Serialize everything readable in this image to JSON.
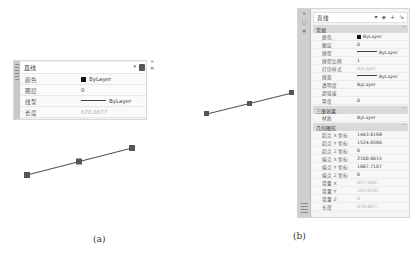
{
  "panel_a": {
    "title": "直线",
    "dropdown_icon": "chevron-down-icon",
    "quick_select_icon": "quick-select-icon",
    "rows": [
      {
        "label": "颜色",
        "value": "ByLayer",
        "swatch": "#111111"
      },
      {
        "label": "图层",
        "value": "0"
      },
      {
        "label": "线型",
        "value": "ByLayer",
        "line": true
      },
      {
        "label": "长度",
        "value": "678.8677",
        "dim": true
      }
    ],
    "side_buttons": [
      "×",
      "≡"
    ],
    "caption": "(a)"
  },
  "panel_b": {
    "strip_buttons": [
      "×",
      "▢",
      "≡"
    ],
    "title": "直线",
    "tools": "▾ ◈ + ⇘",
    "sections": [
      {
        "label": "常规",
        "rows": [
          {
            "label": "颜色",
            "value": "ByLayer",
            "swatch": "#111111"
          },
          {
            "label": "图层",
            "value": "0"
          },
          {
            "label": "线型",
            "value": "ByLayer",
            "line": true
          },
          {
            "label": "线型比例",
            "value": "1"
          },
          {
            "label": "打印样式",
            "value": "ByLayer",
            "dim": true
          },
          {
            "label": "线宽",
            "value": "ByLayer",
            "line": true
          },
          {
            "label": "透明度",
            "value": "ByLayer"
          },
          {
            "label": "超链接",
            "value": ""
          },
          {
            "label": "厚度",
            "value": "0"
          }
        ]
      },
      {
        "label": "三维效果",
        "rows": [
          {
            "label": "材质",
            "value": "ByLayer"
          }
        ]
      },
      {
        "label": "几何图形",
        "rows": [
          {
            "label": "起点 X 坐标",
            "value": "1443.6168"
          },
          {
            "label": "起点 Y 坐标",
            "value": "1524.0566"
          },
          {
            "label": "起点 Z 坐标",
            "value": "0"
          },
          {
            "label": "端点 X 坐标",
            "value": "2100.6615"
          },
          {
            "label": "端点 Y 坐标",
            "value": "1687.7107"
          },
          {
            "label": "端点 Z 坐标",
            "value": "0"
          },
          {
            "label": "增量 X",
            "value": "657.0447",
            "dim": true
          },
          {
            "label": "增量 Y",
            "value": "162.6541",
            "dim": true
          },
          {
            "label": "增量 Z",
            "value": "0",
            "dim": true
          },
          {
            "label": "长度",
            "value": "676.8677",
            "dim": true
          }
        ]
      }
    ],
    "caption": "(b)"
  },
  "colors": {
    "line": "#555555",
    "grip": "#555555",
    "section_bg": "#d9d9d9",
    "panel_bg": "#f4f4f4"
  }
}
